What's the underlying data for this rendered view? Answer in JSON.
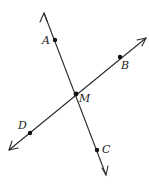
{
  "diagram": {
    "type": "intersecting-lines",
    "lines": [
      {
        "id": "line-AC",
        "points": [
          "A",
          "M",
          "C"
        ],
        "arrows_both_ends": true
      },
      {
        "id": "line-DB",
        "points": [
          "D",
          "M",
          "B"
        ],
        "arrows_both_ends": true
      }
    ],
    "points": [
      {
        "id": "A",
        "label": "A"
      },
      {
        "id": "B",
        "label": "B"
      },
      {
        "id": "M",
        "label": "M"
      },
      {
        "id": "D",
        "label": "D"
      },
      {
        "id": "C",
        "label": "C"
      }
    ],
    "colors": {
      "line": "#2a2a2a",
      "point": "#111111",
      "label": "#222222",
      "background": "#ffffff"
    }
  }
}
